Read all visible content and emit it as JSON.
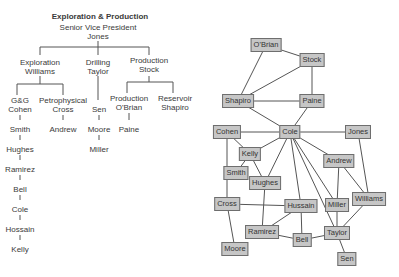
{
  "org_chart": {
    "title": "Exploration & Production",
    "root": {
      "role": "Senior Vice President",
      "name": "Jones"
    },
    "divisions": [
      {
        "role": "Exploration",
        "name": "Williams"
      },
      {
        "role": "Drilling",
        "name": "Taylor"
      },
      {
        "role": "Production",
        "name": "Stock"
      }
    ],
    "subunits": [
      {
        "role": "G&G",
        "name": "Cohen"
      },
      {
        "role": "Petrophysical",
        "name": "Cross"
      },
      {
        "role": "Production",
        "name": "O'Brian"
      },
      {
        "role": "Reservoir",
        "name": "Shapiro"
      }
    ],
    "gg_chain": [
      "Smith",
      "Hughes",
      "Ramirez",
      "Bell",
      "Cole",
      "Hossain",
      "Kelly"
    ],
    "petro_chain": [
      "Andrew"
    ],
    "drilling_chain": [
      "Sen",
      "Moore",
      "Miller"
    ],
    "production_chain": [
      "Paine"
    ]
  },
  "network": {
    "nodes": [
      {
        "id": "obrian",
        "label": "O'Brian",
        "x": 66,
        "y": 45
      },
      {
        "id": "stock",
        "label": "Stock",
        "x": 112,
        "y": 60
      },
      {
        "id": "shapiro",
        "label": "Shapiro",
        "x": 38,
        "y": 101
      },
      {
        "id": "paine",
        "label": "Paine",
        "x": 112,
        "y": 101
      },
      {
        "id": "cohen",
        "label": "Cohen",
        "x": 27,
        "y": 132
      },
      {
        "id": "cole",
        "label": "Cole",
        "x": 90,
        "y": 132
      },
      {
        "id": "jones",
        "label": "Jones",
        "x": 158,
        "y": 132
      },
      {
        "id": "kelly",
        "label": "Kelly",
        "x": 50,
        "y": 154
      },
      {
        "id": "andrew",
        "label": "Andrew",
        "x": 139,
        "y": 161
      },
      {
        "id": "smith",
        "label": "Smith",
        "x": 36,
        "y": 173
      },
      {
        "id": "hughes",
        "label": "Hughes",
        "x": 65,
        "y": 183
      },
      {
        "id": "cross",
        "label": "Cross",
        "x": 27,
        "y": 204
      },
      {
        "id": "hussain",
        "label": "Hussain",
        "x": 101,
        "y": 206
      },
      {
        "id": "miller",
        "label": "Miller",
        "x": 137,
        "y": 205
      },
      {
        "id": "williams",
        "label": "Williams",
        "x": 169,
        "y": 199
      },
      {
        "id": "ramirez",
        "label": "Ramirez",
        "x": 62,
        "y": 232
      },
      {
        "id": "bell",
        "label": "Bell",
        "x": 102,
        "y": 240
      },
      {
        "id": "taylor",
        "label": "Taylor",
        "x": 137,
        "y": 233
      },
      {
        "id": "moore",
        "label": "Moore",
        "x": 35,
        "y": 249
      },
      {
        "id": "sen",
        "label": "Sen",
        "x": 147,
        "y": 259
      }
    ],
    "edges": [
      [
        "obrian",
        "stock"
      ],
      [
        "obrian",
        "shapiro"
      ],
      [
        "stock",
        "shapiro"
      ],
      [
        "stock",
        "paine"
      ],
      [
        "shapiro",
        "paine"
      ],
      [
        "shapiro",
        "cole"
      ],
      [
        "paine",
        "cole"
      ],
      [
        "cohen",
        "cole"
      ],
      [
        "cole",
        "jones"
      ],
      [
        "cohen",
        "kelly"
      ],
      [
        "cohen",
        "cross"
      ],
      [
        "cole",
        "kelly"
      ],
      [
        "cole",
        "hughes"
      ],
      [
        "cole",
        "hussain"
      ],
      [
        "cole",
        "taylor"
      ],
      [
        "cole",
        "miller"
      ],
      [
        "cole",
        "andrew"
      ],
      [
        "kelly",
        "smith"
      ],
      [
        "kelly",
        "hughes"
      ],
      [
        "jones",
        "williams"
      ],
      [
        "andrew",
        "miller"
      ],
      [
        "andrew",
        "williams"
      ],
      [
        "hughes",
        "ramirez"
      ],
      [
        "cross",
        "hussain"
      ],
      [
        "cross",
        "moore"
      ],
      [
        "hussain",
        "ramirez"
      ],
      [
        "hussain",
        "bell"
      ],
      [
        "ramirez",
        "bell"
      ],
      [
        "bell",
        "taylor"
      ],
      [
        "miller",
        "taylor"
      ],
      [
        "williams",
        "taylor"
      ],
      [
        "taylor",
        "sen"
      ]
    ],
    "colors": {
      "node_fill": "#c6c6c6",
      "node_border": "#6e6e6e",
      "edge": "#555555"
    }
  }
}
